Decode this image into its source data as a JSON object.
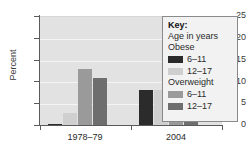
{
  "chart_data": {
    "type": "bar",
    "title": "",
    "xlabel": "",
    "ylabel": "Percent",
    "ylim": [
      0,
      25
    ],
    "yticks": [
      0,
      5,
      10,
      15,
      20,
      25
    ],
    "grid": true,
    "legend_position": "right",
    "categories": [
      "1978–79",
      "2004"
    ],
    "series": [
      {
        "name": "Obese 6–11",
        "color": "#2b2b2b",
        "values": [
          0.4,
          8.2
        ]
      },
      {
        "name": "Obese 12–17",
        "color": "#cfcfcf",
        "values": [
          3.0,
          8.3
        ]
      },
      {
        "name": "Overweight 6–11",
        "color": "#9a9a9a",
        "values": [
          13.0,
          18.0
        ]
      },
      {
        "name": "Overweight 12–17",
        "color": "#6e6e6e",
        "values": [
          11.0,
          20.3
        ]
      }
    ]
  },
  "axis": {
    "ytick_labels": [
      "25",
      "20",
      "15",
      "10",
      "5",
      "0"
    ],
    "ylabel": "Percent",
    "xtick_labels": [
      "1978–79",
      "2004"
    ]
  },
  "legend": {
    "title": "Key:",
    "subtitle": "Age in years",
    "groups": [
      {
        "heading": "Obese",
        "entries": [
          {
            "label": "6–11",
            "color": "#2b2b2b"
          },
          {
            "label": "12–17",
            "color": "#cfcfcf"
          }
        ]
      },
      {
        "heading": "Overweight",
        "entries": [
          {
            "label": "6–11",
            "color": "#9a9a9a"
          },
          {
            "label": "12–17",
            "color": "#6e6e6e"
          }
        ]
      }
    ]
  }
}
